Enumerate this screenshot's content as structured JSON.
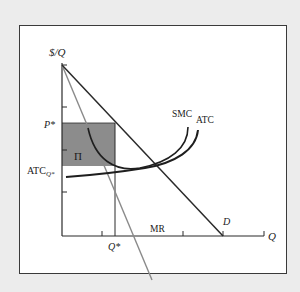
{
  "diagram": {
    "type": "monopoly-profit-maximization",
    "colors": {
      "background": "#ececec",
      "panel": "#ffffff",
      "frame": "#3a3a3a",
      "axis": "#2a2a2a",
      "demand": "#2a2a2a",
      "mr": "#8a8a8a",
      "curves": "#1e1e1e",
      "profit_area": "#8c8c8c"
    },
    "axes": {
      "y_label": "$/Q",
      "x_label": "Q"
    },
    "labels": {
      "price": "P*",
      "atc_base": "ATC",
      "atc_sub": "Q*",
      "quantity": "Q*",
      "profit": "Π",
      "smc": "SMC",
      "atc": "ATC",
      "mr": "MR",
      "demand": "D"
    }
  }
}
